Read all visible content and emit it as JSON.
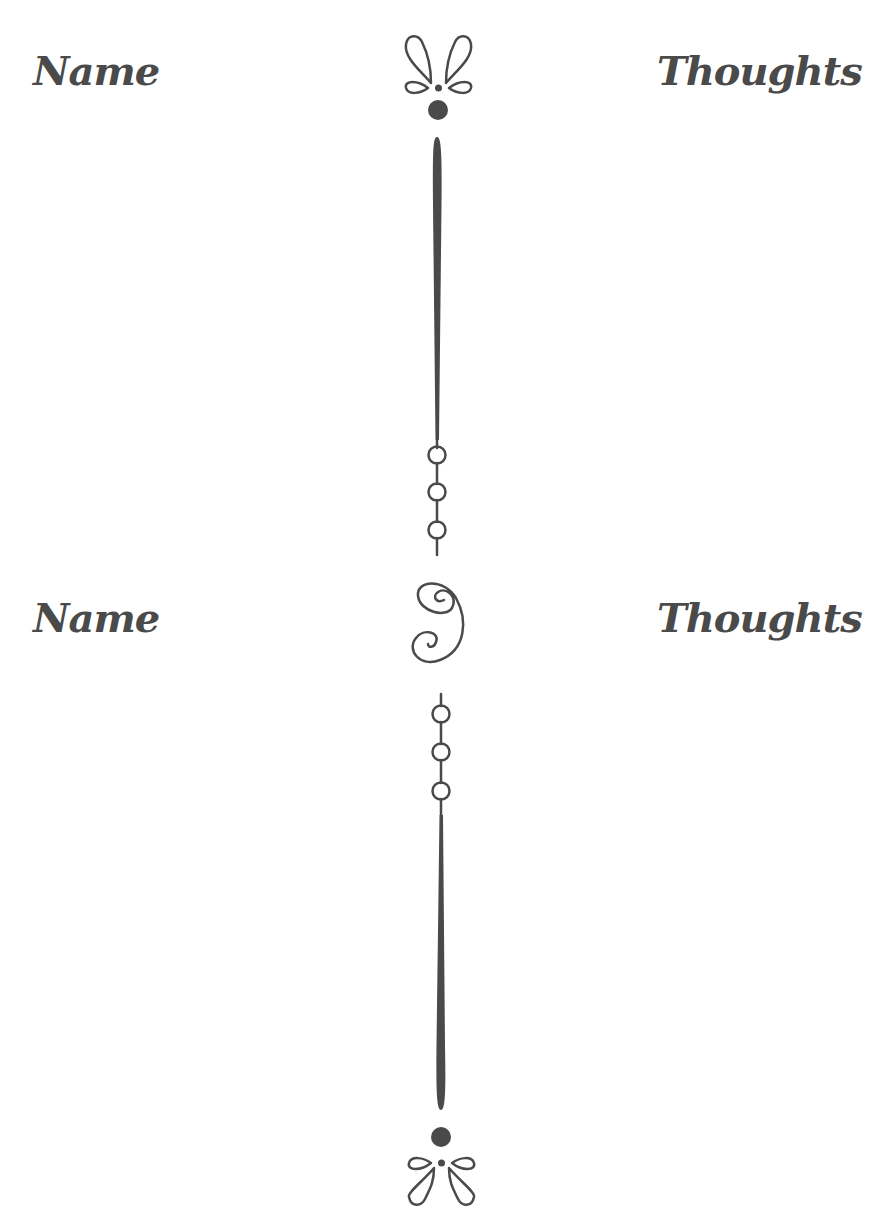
{
  "page": {
    "background": "#ffffff",
    "ink_color": "#4a4a4a"
  },
  "sections": [
    {
      "left_label": "Name",
      "right_label": "Thoughts"
    },
    {
      "left_label": "Name",
      "right_label": "Thoughts"
    }
  ],
  "ornaments": {
    "top": "flourish-icon",
    "middle": "swirl-s-icon",
    "bottom": "flourish-icon",
    "beads": "bead-chain-icon"
  }
}
